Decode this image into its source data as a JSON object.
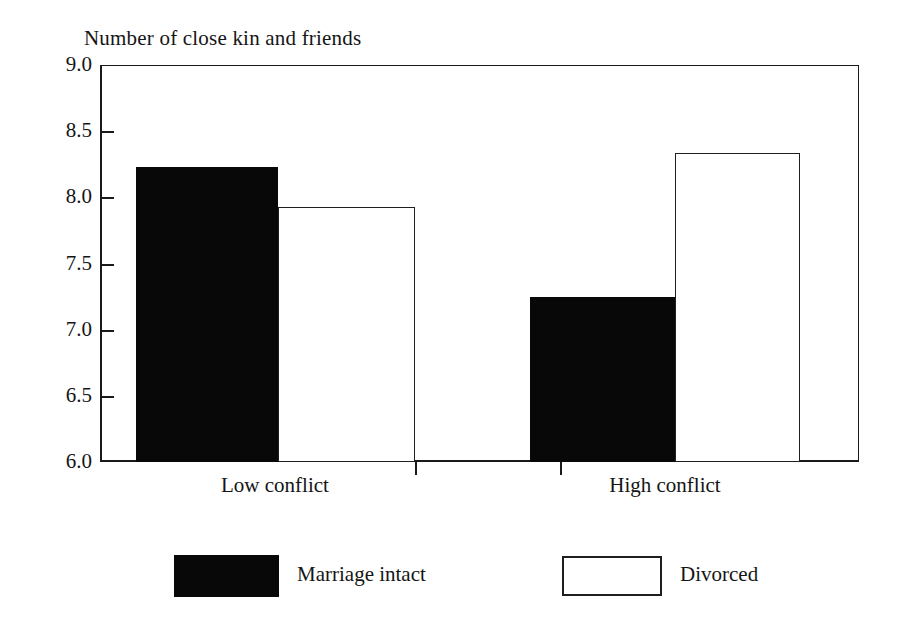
{
  "chart_data": {
    "type": "bar",
    "title": "Number of close kin and friends",
    "xlabel": "",
    "ylabel": "Number of close kin and friends",
    "ylim": [
      6.0,
      9.0
    ],
    "yticks": [
      "9.0",
      "8.5",
      "8.0",
      "7.5",
      "7.0",
      "6.5",
      "6.0"
    ],
    "ytick_values": [
      9.0,
      8.5,
      8.0,
      7.5,
      7.0,
      6.5,
      6.0
    ],
    "grid": false,
    "legend_position": "bottom",
    "categories": [
      "Low conflict",
      "High conflict"
    ],
    "series": [
      {
        "name": "Marriage intact",
        "fill": "#080808",
        "style": "solid",
        "values": [
          8.2,
          7.2
        ]
      },
      {
        "name": "Divorced",
        "fill": "#ffffff",
        "style": "outline",
        "values": [
          7.9,
          8.3
        ]
      }
    ]
  },
  "figure": {
    "background": "#ffffff",
    "axis_color": "#1a1a1a",
    "text_color": "#151515"
  },
  "axis_title": "Number of close kin and friends",
  "yticks": [
    {
      "label": "9.0",
      "top": 65,
      "tick": false
    },
    {
      "label": "8.5",
      "top": 131,
      "tick": true
    },
    {
      "label": "8.0",
      "top": 197,
      "tick": true
    },
    {
      "label": "7.5",
      "top": 264,
      "tick": true
    },
    {
      "label": "7.0",
      "top": 330,
      "tick": true
    },
    {
      "label": "6.5",
      "top": 396,
      "tick": true
    },
    {
      "label": "6.0",
      "top": 462,
      "tick": false
    }
  ],
  "groups": [
    {
      "label": "Low conflict",
      "left": 170,
      "width": 210
    },
    {
      "label": "High conflict",
      "left": 560,
      "width": 210
    }
  ],
  "xticks": [
    415,
    560
  ],
  "bars": [
    {
      "name": "bar-low-conflict-marriage-intact",
      "series": "Marriage intact",
      "category": "Low conflict",
      "value": 8.2,
      "style": "filled",
      "left": 136,
      "width": 142,
      "top": 167,
      "height": 295
    },
    {
      "name": "bar-low-conflict-divorced",
      "series": "Divorced",
      "category": "Low conflict",
      "value": 7.9,
      "style": "hollow",
      "left": 278,
      "width": 137,
      "top": 207,
      "height": 255
    },
    {
      "name": "bar-high-conflict-marriage-intact",
      "series": "Marriage intact",
      "category": "High conflict",
      "value": 7.2,
      "style": "filled",
      "left": 530,
      "width": 145,
      "top": 297,
      "height": 165
    },
    {
      "name": "bar-high-conflict-divorced",
      "series": "Divorced",
      "category": "High conflict",
      "value": 8.3,
      "style": "hollow",
      "left": 675,
      "width": 125,
      "top": 153,
      "height": 309
    }
  ],
  "legend": {
    "entries": [
      {
        "label": "Marriage intact",
        "style": "filled",
        "swatch_left": 174,
        "swatch_top": 555,
        "swatch_width": 105,
        "swatch_height": 42,
        "label_left": 297,
        "label_top": 561
      },
      {
        "label": "Divorced",
        "style": "hollow",
        "swatch_left": 562,
        "swatch_top": 556,
        "swatch_width": 100,
        "swatch_height": 40,
        "label_left": 680,
        "label_top": 561
      }
    ]
  }
}
